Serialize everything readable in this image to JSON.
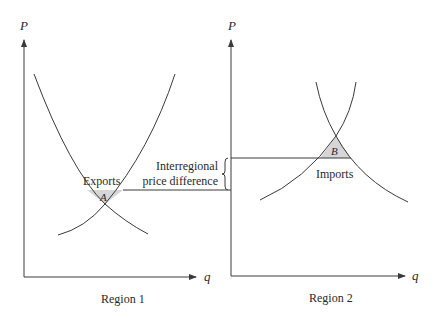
{
  "diagram": {
    "type": "trade-supply-demand",
    "region1": {
      "title": "Region 1",
      "y_axis_label": "P",
      "x_axis_label": "q",
      "equilibrium_label": "A",
      "flow_label": "Exports"
    },
    "region2": {
      "title": "Region 2",
      "y_axis_label": "P",
      "x_axis_label": "q",
      "equilibrium_label": "B",
      "flow_label": "Imports"
    },
    "annotation": {
      "line1": "Interregional",
      "line2": "price difference"
    },
    "colors": {
      "line": "#3a3a3a",
      "shade": "#d6d6d6",
      "text": "#2a2a2a"
    }
  }
}
